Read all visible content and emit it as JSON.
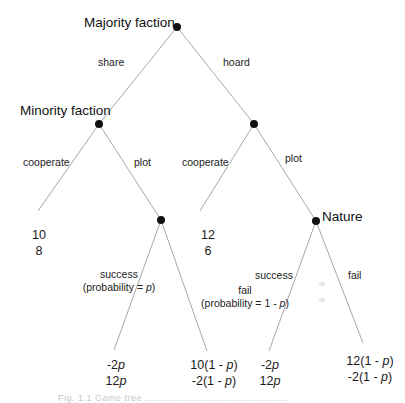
{
  "diagram": {
    "type": "extensive-form game tree",
    "colors": {
      "edge": "#a8a8a8",
      "node": "#111111",
      "text": "#1a1a1a"
    },
    "players": {
      "root": "Majority faction",
      "left_mid": "Minority faction",
      "right_chance": "Nature"
    },
    "actions": {
      "share": "share",
      "hoard": "hoard",
      "cooperate_left": "cooperate",
      "plot_left": "plot",
      "cooperate_right": "cooperate",
      "plot_right": "plot",
      "success_left": "success",
      "fail_left": "fail",
      "success_right": "success",
      "fail_right": "fail"
    },
    "probabilities": {
      "success_left_prefix": "(probability = ",
      "success_left_var": "p",
      "success_left_suffix": ")",
      "fail_left_prefix": "(probability = 1 - ",
      "fail_left_var": "p",
      "fail_left_suffix": ")"
    },
    "payoffs": [
      {
        "id": "share-cooperate",
        "line1": "10",
        "line2": "8"
      },
      {
        "id": "share-plot-success",
        "line1_num": "-2",
        "line1_var": "p",
        "line2_num": "12",
        "line2_var": "p"
      },
      {
        "id": "share-plot-fail",
        "line1_pre": "10(1 - ",
        "line1_var": "p",
        "line1_post": ")",
        "line2_pre": "-2(1 - ",
        "line2_var": "p",
        "line2_post": ")"
      },
      {
        "id": "hoard-cooperate",
        "line1": "12",
        "line2": "6"
      },
      {
        "id": "hoard-plot-success",
        "line1_num": "-2",
        "line1_var": "p",
        "line2_num": "12",
        "line2_var": "p"
      },
      {
        "id": "hoard-plot-fail",
        "line1_pre": "12(1 - ",
        "line1_var": "p",
        "line1_post": ")",
        "line2_pre": "-2(1 - ",
        "line2_var": "p",
        "line2_post": ")"
      }
    ],
    "caption": "Fig. 1.1   Game tree ................................................"
  }
}
